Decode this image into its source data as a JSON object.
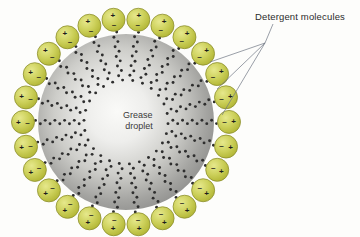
{
  "figure": {
    "type": "micelle-diagram",
    "title_visible": false,
    "background_color": "#fdfdfb"
  },
  "center_label": {
    "line1": "Grease",
    "line2": "droplet",
    "x": 139,
    "y": 118,
    "color": "#3a3a3a"
  },
  "callout": {
    "label": "Detergent molecules",
    "label_x": 255,
    "label_y": 20,
    "color": "#2b2b2b",
    "leader_origin": {
      "x": 265,
      "y": 43
    },
    "leader_lines": [
      {
        "x1": 265,
        "y1": 43,
        "x2": 210,
        "y2": 62
      },
      {
        "x1": 265,
        "y1": 43,
        "x2": 217,
        "y2": 89
      },
      {
        "x1": 265,
        "y1": 43,
        "x2": 222,
        "y2": 115
      }
    ]
  },
  "droplet": {
    "cx": 126,
    "cy": 122,
    "r": 88,
    "gradient_inner": "#f4f4f2",
    "gradient_mid": "#c9c9c5",
    "gradient_outer": "#8e8e8c",
    "label": "Grease droplet"
  },
  "molecule": {
    "head_fill_light": "#e0e37a",
    "head_fill_dark": "#b9bd3c",
    "head_stroke": "#8d8f2f",
    "head_radius": 11.5,
    "tail_color": "#2e2e2e",
    "tail_bead_count": 11,
    "positive_sign": "+",
    "negative_sign": "–",
    "count": 26,
    "head_orbit_radius": 103,
    "tail_inner_radius": 42
  },
  "colors": {
    "accent_head": "#c8cc52",
    "leader_line": "#6e7683",
    "text": "#2b2b2b"
  }
}
